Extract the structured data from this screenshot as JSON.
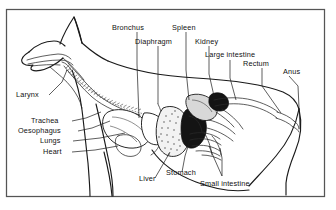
{
  "figure": {
    "view": "lateral left-facing",
    "frame_color": "#555555",
    "ink_color": "#1a1a1a",
    "background_color": "#ffffff"
  },
  "labels": {
    "bronchus": "Bronchus",
    "diaphragm": "Diaphragm",
    "spleen": "Spleen",
    "kidney": "Kidney",
    "large_intestine": "Large intestine",
    "rectum": "Rectum",
    "anus": "Anus",
    "larynx": "Larynx",
    "trachea": "Trachea",
    "oesophagus": "Oesophagus",
    "lungs": "Lungs",
    "heart": "Heart",
    "liver": "Liver",
    "stomach": "Stomach",
    "small_intestine": "Small intestine"
  }
}
